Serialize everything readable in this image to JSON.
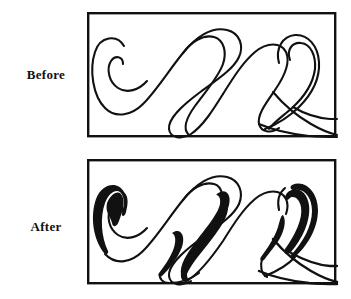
{
  "figure": {
    "title_present": false,
    "background_color": "#ffffff",
    "ink_color": "#111111",
    "panels": [
      {
        "id": "before",
        "label": "Before",
        "frame": {
          "x": 87,
          "y": 13,
          "width": 248,
          "height": 124,
          "border_width": 2.4
        },
        "stroke_style": "monoline",
        "stroke_width": 2.1,
        "description": "Uniform thin calligraphic flourish"
      },
      {
        "id": "after",
        "label": "After",
        "frame": {
          "x": 87,
          "y": 160,
          "width": 248,
          "height": 123,
          "border_width": 2.4
        },
        "stroke_style": "variable-width",
        "stroke_width_thin": 2.1,
        "stroke_width_thick": 13,
        "description": "Same flourish with thickened downstrokes"
      }
    ]
  },
  "labels": {
    "before": "Before",
    "after": "After"
  }
}
